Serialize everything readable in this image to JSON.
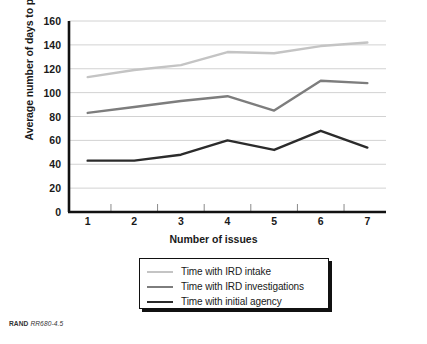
{
  "figure": {
    "source_note_brand": "RAND",
    "source_note_code": "RR680-4.5"
  },
  "chart_data": {
    "type": "line",
    "title": "",
    "xlabel": "Number of issues",
    "ylabel": "Average number of days to process",
    "categories": [
      "1",
      "2",
      "3",
      "4",
      "5",
      "6",
      "7"
    ],
    "x": [
      1,
      2,
      3,
      4,
      5,
      6,
      7
    ],
    "xlim": [
      0.6,
      7.4
    ],
    "ylim": [
      0,
      160
    ],
    "yticks": [
      "0",
      "20",
      "40",
      "60",
      "80",
      "100",
      "120",
      "140",
      "160"
    ],
    "grid": "horizontal",
    "legend_position": "bottom-center",
    "series": [
      {
        "name": "Time with IRD intake",
        "color": "#c4c4c4",
        "values": [
          113,
          119,
          123,
          134,
          133,
          139,
          142
        ]
      },
      {
        "name": "Time with IRD investigations",
        "color": "#7d7d7d",
        "values": [
          83,
          88,
          93,
          97,
          85,
          110,
          108
        ]
      },
      {
        "name": "Time with initial agency",
        "color": "#2b2b2b",
        "values": [
          43,
          43,
          48,
          60,
          52,
          68,
          54
        ]
      }
    ]
  }
}
